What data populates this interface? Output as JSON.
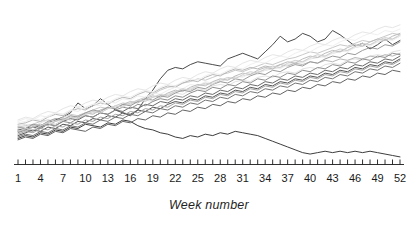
{
  "chart_data": {
    "type": "line",
    "title": "",
    "subtitle": "",
    "xlabel": "Week number",
    "ylabel": "",
    "grid": false,
    "legend": "none",
    "axis_style": "x-axis only, ticks point upward, one tick per week",
    "xlim": [
      1,
      52
    ],
    "xtick_labels": [
      "1",
      "4",
      "7",
      "10",
      "13",
      "16",
      "19",
      "22",
      "25",
      "28",
      "31",
      "34",
      "37",
      "40",
      "43",
      "46",
      "49",
      "52"
    ],
    "xtick_values": [
      1,
      4,
      7,
      10,
      13,
      16,
      19,
      22,
      25,
      28,
      31,
      34,
      37,
      40,
      43,
      46,
      49,
      52
    ],
    "xtick_step": 3,
    "minor_ticks_every": 1,
    "ylim": [
      0,
      100
    ],
    "ytick_labels": [],
    "x": [
      1,
      2,
      3,
      4,
      5,
      6,
      7,
      8,
      9,
      10,
      11,
      12,
      13,
      14,
      15,
      16,
      17,
      18,
      19,
      20,
      21,
      22,
      23,
      24,
      25,
      26,
      27,
      28,
      29,
      30,
      31,
      32,
      33,
      34,
      35,
      36,
      37,
      38,
      39,
      40,
      41,
      42,
      43,
      44,
      45,
      46,
      47,
      48,
      49,
      50,
      51,
      52
    ],
    "series": [
      {
        "name": "series-1",
        "color": "#4a4a4a",
        "width": 1.0,
        "values": [
          24,
          25,
          27,
          26,
          29,
          31,
          33,
          36,
          43,
          39,
          41,
          46,
          42,
          38,
          36,
          34,
          38,
          46,
          52,
          60,
          66,
          68,
          67,
          70,
          72,
          71,
          70,
          69,
          74,
          76,
          78,
          76,
          74,
          79,
          84,
          90,
          86,
          88,
          92,
          90,
          86,
          88,
          94,
          91,
          87,
          83,
          85,
          81,
          84,
          88,
          84,
          87
        ]
      },
      {
        "name": "series-2",
        "color": "#c9c9c9",
        "width": 1.0,
        "values": [
          26,
          27,
          28,
          30,
          31,
          30,
          33,
          35,
          34,
          36,
          38,
          40,
          39,
          41,
          43,
          42,
          45,
          47,
          49,
          52,
          54,
          55,
          57,
          58,
          60,
          59,
          61,
          63,
          64,
          66,
          65,
          67,
          69,
          71,
          70,
          72,
          74,
          75,
          77,
          79,
          78,
          80,
          82,
          84,
          83,
          85,
          87,
          86,
          88,
          90,
          92,
          91
        ]
      },
      {
        "name": "series-3",
        "color": "#d8d8d8",
        "width": 1.0,
        "values": [
          25,
          26,
          27,
          27,
          29,
          30,
          31,
          33,
          34,
          35,
          36,
          38,
          39,
          40,
          41,
          43,
          44,
          45,
          47,
          48,
          49,
          51,
          52,
          53,
          55,
          56,
          57,
          58,
          60,
          61,
          62,
          63,
          65,
          66,
          67,
          68,
          70,
          71,
          72,
          74,
          75,
          76,
          78,
          79,
          80,
          82,
          83,
          84,
          86,
          87,
          88,
          90
        ]
      },
      {
        "name": "series-4",
        "color": "#e2e2e2",
        "width": 1.0,
        "values": [
          27,
          28,
          26,
          29,
          31,
          30,
          32,
          34,
          33,
          36,
          37,
          36,
          39,
          40,
          42,
          41,
          44,
          45,
          44,
          47,
          48,
          50,
          49,
          52,
          53,
          52,
          55,
          56,
          55,
          58,
          59,
          58,
          61,
          62,
          61,
          64,
          65,
          64,
          67,
          68,
          67,
          70,
          71,
          70,
          73,
          74,
          73,
          76,
          77,
          76,
          79,
          80
        ]
      },
      {
        "name": "series-5",
        "color": "#b8b8b8",
        "width": 1.0,
        "values": [
          28,
          29,
          31,
          30,
          33,
          35,
          34,
          37,
          39,
          38,
          41,
          43,
          42,
          45,
          47,
          46,
          49,
          51,
          50,
          53,
          55,
          54,
          57,
          59,
          58,
          61,
          63,
          62,
          65,
          67,
          66,
          68,
          67,
          69,
          68,
          70,
          69,
          71,
          70,
          72,
          71,
          73,
          72,
          74,
          73,
          75,
          74,
          76,
          75,
          77,
          76,
          78
        ]
      },
      {
        "name": "series-6",
        "color": "#6b6b6b",
        "width": 1.0,
        "values": [
          23,
          24,
          26,
          25,
          28,
          27,
          30,
          32,
          31,
          34,
          33,
          36,
          35,
          38,
          37,
          40,
          39,
          42,
          41,
          44,
          43,
          46,
          45,
          48,
          47,
          50,
          49,
          52,
          51,
          54,
          53,
          56,
          55,
          58,
          57,
          60,
          59,
          62,
          61,
          64,
          63,
          66,
          65,
          68,
          67,
          70,
          69,
          72,
          71,
          74,
          73,
          76
        ]
      },
      {
        "name": "series-7",
        "color": "#8f8f8f",
        "width": 1.0,
        "values": [
          22,
          24,
          23,
          26,
          28,
          27,
          30,
          29,
          32,
          34,
          33,
          36,
          35,
          38,
          40,
          39,
          42,
          41,
          44,
          46,
          45,
          48,
          47,
          50,
          52,
          51,
          54,
          53,
          56,
          55,
          58,
          57,
          60,
          59,
          62,
          61,
          64,
          63,
          66,
          65,
          68,
          67,
          70,
          69,
          72,
          71,
          74,
          73,
          76,
          75,
          78,
          77
        ]
      },
      {
        "name": "series-8",
        "color": "#555555",
        "width": 1.0,
        "values": [
          20,
          22,
          24,
          23,
          26,
          25,
          28,
          27,
          30,
          29,
          32,
          31,
          34,
          33,
          36,
          35,
          38,
          37,
          40,
          39,
          42,
          44,
          43,
          46,
          45,
          48,
          47,
          50,
          49,
          52,
          51,
          54,
          53,
          56,
          55,
          58,
          57,
          60,
          59,
          62,
          61,
          64,
          63,
          66,
          65,
          68,
          67,
          70,
          69,
          72,
          71,
          74
        ]
      },
      {
        "name": "series-9",
        "color": "#a5a5a5",
        "width": 1.0,
        "values": [
          21,
          23,
          22,
          25,
          24,
          27,
          26,
          29,
          28,
          31,
          30,
          33,
          32,
          35,
          34,
          37,
          36,
          39,
          38,
          41,
          40,
          43,
          42,
          45,
          44,
          47,
          46,
          49,
          48,
          51,
          50,
          53,
          52,
          55,
          54,
          57,
          56,
          59,
          58,
          61,
          60,
          63,
          62,
          65,
          64,
          67,
          66,
          69,
          68,
          71,
          70,
          73
        ]
      },
      {
        "name": "series-10",
        "color": "#ededed",
        "width": 1.0,
        "values": [
          30,
          32,
          31,
          34,
          33,
          36,
          35,
          38,
          37,
          40,
          42,
          41,
          44,
          43,
          46,
          45,
          48,
          47,
          50,
          49,
          52,
          54,
          53,
          56,
          55,
          58,
          57,
          60,
          59,
          62,
          61,
          64,
          63,
          66,
          68,
          67,
          70,
          72,
          71,
          74,
          76,
          75,
          78,
          80,
          79,
          82,
          84,
          83,
          86,
          88,
          87,
          90
        ]
      },
      {
        "name": "series-11",
        "color": "#f0f0f0",
        "width": 1.0,
        "values": [
          29,
          30,
          32,
          31,
          34,
          36,
          35,
          38,
          40,
          39,
          42,
          44,
          43,
          46,
          48,
          47,
          50,
          52,
          51,
          54,
          56,
          55,
          58,
          60,
          59,
          62,
          64,
          63,
          66,
          68,
          67,
          70,
          72,
          71,
          74,
          76,
          75,
          78,
          80,
          79,
          82,
          84,
          83,
          86,
          88,
          87,
          90,
          92,
          91,
          94,
          93,
          95
        ]
      },
      {
        "name": "series-12",
        "color": "#3d3d3d",
        "width": 1.0,
        "values": [
          18,
          20,
          19,
          22,
          21,
          24,
          23,
          26,
          25,
          28,
          27,
          26,
          29,
          28,
          31,
          30,
          27,
          25,
          24,
          22,
          21,
          19,
          18,
          20,
          19,
          21,
          20,
          22,
          21,
          23,
          22,
          21,
          20,
          18,
          16,
          14,
          12,
          10,
          8,
          7,
          8,
          9,
          8,
          9,
          8,
          9,
          8,
          9,
          8,
          7,
          6,
          5
        ]
      },
      {
        "name": "series-13",
        "color": "#767676",
        "width": 1.0,
        "values": [
          19,
          21,
          20,
          23,
          22,
          25,
          24,
          27,
          26,
          29,
          28,
          31,
          30,
          33,
          32,
          35,
          34,
          37,
          36,
          39,
          38,
          41,
          40,
          43,
          42,
          45,
          44,
          47,
          46,
          49,
          48,
          51,
          50,
          53,
          52,
          55,
          54,
          57,
          56,
          59,
          58,
          61,
          60,
          63,
          62,
          65,
          64,
          67,
          66,
          69,
          68,
          71
        ]
      },
      {
        "name": "series-14",
        "color": "#bdbdbd",
        "width": 1.0,
        "values": [
          24,
          23,
          26,
          28,
          27,
          30,
          32,
          31,
          34,
          36,
          35,
          38,
          40,
          39,
          42,
          44,
          43,
          46,
          48,
          47,
          50,
          52,
          51,
          54,
          56,
          55,
          58,
          60,
          59,
          62,
          64,
          63,
          66,
          68,
          67,
          70,
          72,
          71,
          74,
          76,
          75,
          78,
          80,
          79,
          82,
          84,
          83,
          86,
          88,
          87,
          90,
          92
        ]
      },
      {
        "name": "series-15",
        "color": "#e6e6e6",
        "width": 1.0,
        "values": [
          31,
          33,
          32,
          35,
          37,
          36,
          39,
          41,
          40,
          43,
          45,
          44,
          47,
          49,
          48,
          51,
          53,
          52,
          55,
          57,
          56,
          59,
          61,
          60,
          63,
          65,
          64,
          67,
          69,
          68,
          71,
          73,
          72,
          75,
          77,
          76,
          79,
          81,
          80,
          83,
          85,
          84,
          87,
          89,
          88,
          91,
          93,
          92,
          95,
          97,
          96,
          98
        ]
      },
      {
        "name": "series-16",
        "color": "#9b9b9b",
        "width": 1.0,
        "values": [
          26,
          25,
          28,
          27,
          30,
          32,
          31,
          34,
          33,
          36,
          38,
          37,
          40,
          39,
          42,
          41,
          44,
          46,
          45,
          48,
          47,
          50,
          52,
          51,
          54,
          53,
          56,
          58,
          57,
          60,
          59,
          62,
          64,
          63,
          66,
          65,
          68,
          70,
          69,
          72,
          71,
          74,
          76,
          75,
          78,
          77,
          80,
          82,
          81,
          84,
          83,
          86
        ]
      },
      {
        "name": "series-17",
        "color": "#cfcfcf",
        "width": 1.0,
        "values": [
          23,
          25,
          24,
          27,
          29,
          28,
          31,
          33,
          32,
          35,
          37,
          36,
          39,
          41,
          40,
          43,
          45,
          44,
          47,
          49,
          48,
          51,
          53,
          52,
          55,
          57,
          56,
          59,
          61,
          60,
          63,
          65,
          64,
          67,
          69,
          68,
          71,
          73,
          72,
          75,
          77,
          76,
          79,
          81,
          80,
          83,
          85,
          84,
          87,
          89,
          88,
          91
        ]
      },
      {
        "name": "series-18",
        "color": "#646464",
        "width": 1.0,
        "values": [
          17,
          19,
          18,
          21,
          20,
          23,
          22,
          25,
          24,
          23,
          26,
          25,
          28,
          27,
          30,
          29,
          32,
          31,
          34,
          33,
          36,
          35,
          38,
          37,
          40,
          39,
          42,
          41,
          44,
          43,
          46,
          45,
          48,
          47,
          50,
          49,
          52,
          51,
          54,
          53,
          56,
          55,
          58,
          57,
          60,
          59,
          62,
          61,
          64,
          63,
          66,
          65
        ]
      }
    ]
  },
  "plot_geometry": {
    "x_first_tick_px": 18,
    "x_last_tick_px": 400,
    "axis_y_px": 164,
    "plot_top_px": 22,
    "tick_len_px": 5
  }
}
